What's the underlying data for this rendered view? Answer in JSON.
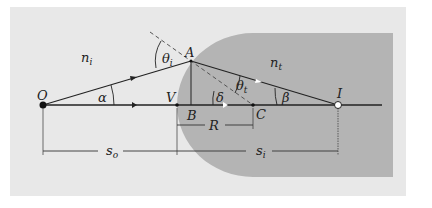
{
  "diagram": {
    "colors": {
      "background": "#ffffff",
      "panel": "#e8e8e8",
      "medium_t": "#b4b4b4",
      "line": "#222222",
      "dashed": "#555555"
    },
    "media": {
      "incident": "n",
      "incident_sub": "i",
      "transmitted": "n",
      "transmitted_sub": "t"
    },
    "points": {
      "O": "O",
      "A": "A",
      "V": "V",
      "B": "B",
      "C": "C",
      "I": "I"
    },
    "angles": {
      "alpha": "α",
      "beta": "β",
      "delta": "δ",
      "theta": "θ",
      "theta_i_sub": "i",
      "theta_t_sub": "t"
    },
    "dimensions": {
      "object_distance": "s",
      "object_distance_sub": "o",
      "image_distance": "s",
      "image_distance_sub": "i",
      "radius": "R"
    }
  }
}
